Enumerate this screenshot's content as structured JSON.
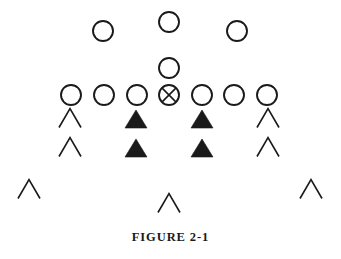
{
  "figure": {
    "caption_label": "FIGURE",
    "caption_number": "2-1",
    "caption_full": "FIGURE 2-1",
    "width": 341,
    "height": 259,
    "background_color": "#ffffff",
    "ink_color": "#1a1a1a"
  },
  "legend": {
    "open_circle": "offensive-player",
    "crossed_circle": "center-with-ball",
    "filled_triangle": "defensive-lineman",
    "open_chevron": "defensive-back-or-linebacker"
  },
  "shapes": {
    "circle_radius": 10,
    "circle_stroke_width": 1.9,
    "triangle_half_width": 11,
    "triangle_height": 18,
    "chevron_half_width": 11,
    "chevron_height": 19,
    "chevron_stroke_width": 1.6
  },
  "groups": [
    {
      "name": "offensive-backs-deep",
      "symbol": "circle",
      "players": [
        {
          "id": "back-left",
          "cx": 103,
          "cy": 31
        },
        {
          "id": "back-middle",
          "cx": 169,
          "cy": 22
        },
        {
          "id": "back-right",
          "cx": 237,
          "cy": 31
        }
      ]
    },
    {
      "name": "quarterback",
      "symbol": "circle",
      "players": [
        {
          "id": "quarterback",
          "cx": 169,
          "cy": 68
        }
      ]
    },
    {
      "name": "offensive-line",
      "symbol": "circle",
      "players": [
        {
          "id": "lineman-far-left",
          "cx": 71,
          "cy": 95
        },
        {
          "id": "lineman-left",
          "cx": 104,
          "cy": 95
        },
        {
          "id": "lineman-inner-left",
          "cx": 137,
          "cy": 95
        },
        {
          "id": "center",
          "cx": 169,
          "cy": 95,
          "symbol": "crossed-circle"
        },
        {
          "id": "lineman-inner-right",
          "cx": 202,
          "cy": 95
        },
        {
          "id": "lineman-right",
          "cx": 234,
          "cy": 95
        },
        {
          "id": "lineman-far-right",
          "cx": 267,
          "cy": 95
        }
      ]
    },
    {
      "name": "defensive-front-row",
      "symbol": "mixed",
      "players": [
        {
          "id": "def-chevron-left",
          "symbol": "chevron",
          "cx": 70,
          "cy": 118
        },
        {
          "id": "def-tackle-left",
          "symbol": "triangle",
          "cx": 136,
          "cy": 119
        },
        {
          "id": "def-tackle-right",
          "symbol": "triangle",
          "cx": 202,
          "cy": 119
        },
        {
          "id": "def-chevron-right",
          "symbol": "chevron",
          "cx": 268,
          "cy": 118
        }
      ]
    },
    {
      "name": "defensive-second-row",
      "symbol": "mixed",
      "players": [
        {
          "id": "def2-chevron-left",
          "symbol": "chevron",
          "cx": 70,
          "cy": 147
        },
        {
          "id": "def2-tackle-left",
          "symbol": "triangle",
          "cx": 136,
          "cy": 148
        },
        {
          "id": "def2-tackle-right",
          "symbol": "triangle",
          "cx": 202,
          "cy": 148
        },
        {
          "id": "def2-chevron-right",
          "symbol": "chevron",
          "cx": 268,
          "cy": 147
        }
      ]
    },
    {
      "name": "defensive-backfield",
      "symbol": "chevron",
      "players": [
        {
          "id": "defensive-back-left",
          "cx": 29,
          "cy": 189
        },
        {
          "id": "defensive-back-middle",
          "cx": 169,
          "cy": 203
        },
        {
          "id": "defensive-back-right",
          "cx": 311,
          "cy": 189
        }
      ]
    }
  ]
}
